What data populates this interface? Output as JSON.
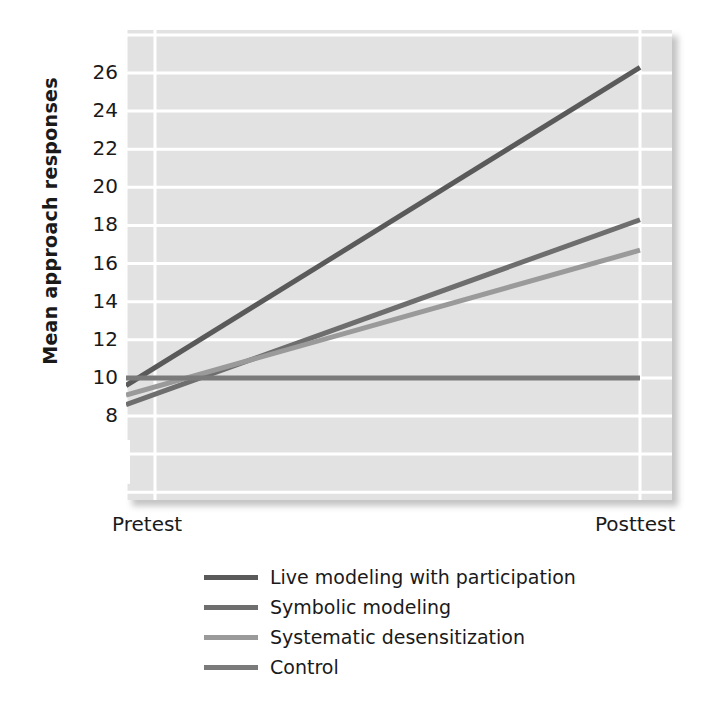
{
  "chart_data": {
    "type": "line",
    "title": "",
    "xlabel": "",
    "ylabel": "Mean approach responses",
    "categories": [
      "Pretest",
      "Posttest"
    ],
    "x_tick_labels": [
      "Pretest",
      "Posttest"
    ],
    "y_tick_labels": [
      "8",
      "10",
      "12",
      "14",
      "16",
      "18",
      "20",
      "22",
      "24",
      "26"
    ],
    "y_ticks": [
      8,
      10,
      12,
      14,
      16,
      18,
      20,
      22,
      24,
      26
    ],
    "ylim": [
      7,
      27.5
    ],
    "grid": true,
    "y_axis_break": true,
    "legend_position": "bottom",
    "series": [
      {
        "name": "Live modeling with participation",
        "values": [
          9.6,
          26.3
        ],
        "color": "#5a5a5a"
      },
      {
        "name": "Symbolic modeling",
        "values": [
          8.6,
          18.3
        ],
        "color": "#6e6e6e"
      },
      {
        "name": "Systematic desensitization",
        "values": [
          9.1,
          16.7
        ],
        "color": "#9a9a9a"
      },
      {
        "name": "Control",
        "values": [
          10.0,
          10.0
        ],
        "color": "#7a7a7a"
      }
    ]
  },
  "axis": {
    "y_title": "Mean approach responses",
    "ticks_y": [
      "26",
      "24",
      "22",
      "20",
      "18",
      "16",
      "14",
      "12",
      "10",
      "8"
    ],
    "tick_pretest": "Pretest",
    "tick_posttest": "Posttest"
  },
  "legend": {
    "items": [
      {
        "label": "Live modeling with participation",
        "color": "#5a5a5a"
      },
      {
        "label": "Symbolic modeling",
        "color": "#6e6e6e"
      },
      {
        "label": "Systematic desensitization",
        "color": "#9a9a9a"
      },
      {
        "label": "Control",
        "color": "#7a7a7a"
      }
    ]
  },
  "style": {
    "plot_background": "#e2e2e2",
    "gridline_color": "#ffffff",
    "page_background": "#ffffff",
    "text_color": "#1a1a1a"
  }
}
